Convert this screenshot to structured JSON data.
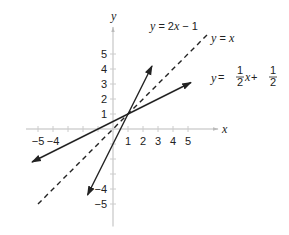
{
  "chart_data": {
    "type": "line",
    "title": "",
    "xlabel": "x",
    "ylabel": "y",
    "xlim": [
      -5.8,
      7
    ],
    "ylim": [
      -6.5,
      6.8
    ],
    "grid": false,
    "x_ticks": [
      -5,
      -4,
      -3,
      -2,
      -1,
      1,
      2,
      3,
      4,
      5
    ],
    "x_tick_labels": [
      "-5",
      "-4",
      "",
      "",
      "",
      "1",
      "2",
      "3",
      "4",
      "5"
    ],
    "y_ticks": [
      -5,
      -4,
      -3,
      -2,
      -1,
      1,
      2,
      3,
      4,
      5
    ],
    "y_tick_labels": [
      "-5",
      "-4",
      "",
      "",
      "",
      "1",
      "2",
      "3",
      "4",
      "5"
    ],
    "series": [
      {
        "name": "y = 2x - 1",
        "label_parts": [
          "y",
          " = 2",
          "x",
          " − 1"
        ],
        "slope": 2,
        "intercept": -1,
        "x_range": [
          -1.7,
          2.6
        ],
        "style": "solid",
        "arrows": "both",
        "color": "#222222"
      },
      {
        "name": "y = x",
        "label_parts": [
          "y",
          " = ",
          "x"
        ],
        "slope": 1,
        "intercept": 0,
        "x_range": [
          -5,
          6.4
        ],
        "style": "dashed",
        "arrows": "none",
        "color": "#222222"
      },
      {
        "name": "y = 1/2 x + 1/2",
        "label_parts": [
          "y",
          " = ",
          "1",
          "2",
          "x",
          " + ",
          "1",
          "2"
        ],
        "slope": 0.5,
        "intercept": 0.5,
        "x_range": [
          -5.4,
          5.2
        ],
        "style": "solid",
        "arrows": "both",
        "color": "#222222"
      }
    ],
    "intersection": {
      "x": 1,
      "y": 1
    }
  }
}
